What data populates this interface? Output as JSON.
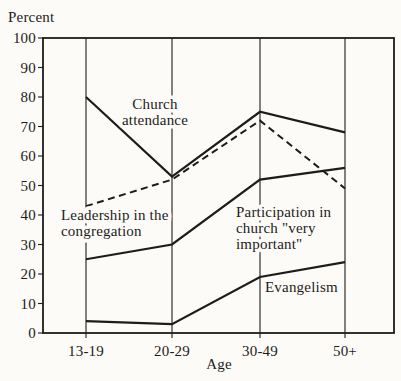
{
  "chart_data": {
    "type": "line",
    "title": "Percent",
    "xlabel": "Age",
    "ylim": [
      0,
      100
    ],
    "ytick_step": 10,
    "grid": "vertical-category-lines",
    "legend_position": "inline-annotations",
    "categories": [
      "13-19",
      "20-29",
      "30-49",
      "50+"
    ],
    "series": [
      {
        "name": "Church attendance",
        "values": [
          80,
          53,
          75,
          68
        ],
        "line_style": "solid",
        "label_lines": [
          "Church",
          "attendance"
        ]
      },
      {
        "name": "Leadership in the congregation",
        "values": [
          43,
          52,
          72,
          49
        ],
        "line_style": "dashed",
        "label_lines": [
          "Leadership in the",
          "congregation"
        ]
      },
      {
        "name": "Participation in church \"very important\"",
        "values": [
          25,
          30,
          52,
          56
        ],
        "line_style": "solid",
        "label_lines": [
          "Participation in",
          "church \"very",
          "important\""
        ]
      },
      {
        "name": "Evangelism",
        "values": [
          4,
          3,
          19,
          24
        ],
        "line_style": "solid",
        "label_lines": [
          "Evangelism"
        ]
      }
    ],
    "colors": {
      "ink": "#1c1c1c",
      "background": "#fcfbf7"
    }
  }
}
